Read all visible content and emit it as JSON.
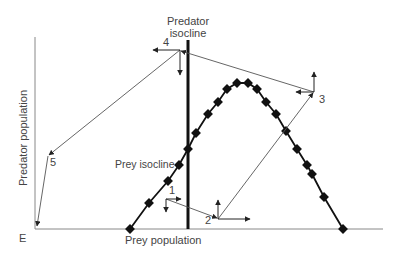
{
  "diagram": {
    "type": "predator-prey phase diagram",
    "axes": {
      "x_label": "Prey population",
      "y_label": "Predator population",
      "origin_label": "E"
    },
    "isoclines": {
      "predator": "Predator\nisocline",
      "predator_line1": "Predator",
      "predator_line2": "isocline",
      "prey": "Prey isocline"
    },
    "points": [
      {
        "id": "1",
        "label": "1"
      },
      {
        "id": "2",
        "label": "2"
      },
      {
        "id": "3",
        "label": "3"
      },
      {
        "id": "4",
        "label": "4"
      },
      {
        "id": "5",
        "label": "5"
      }
    ],
    "colors": {
      "axis": "#888888",
      "isocline": "#111111",
      "trajectory": "#555555",
      "text": "#444444"
    }
  }
}
